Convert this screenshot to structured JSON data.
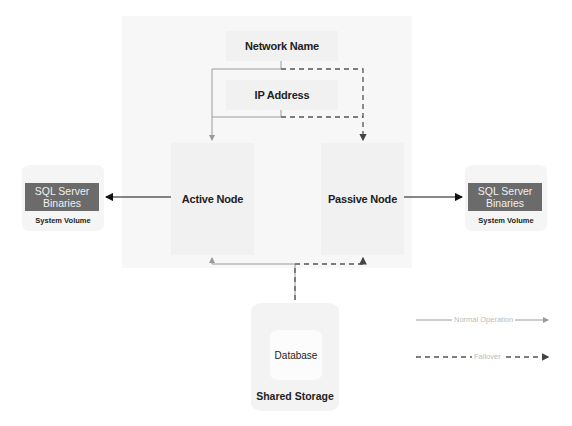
{
  "diagram": {
    "cluster": {
      "network_name": "Network Name",
      "ip_address": "IP Address",
      "active_node": "Active Node",
      "passive_node": "Passive Node"
    },
    "left_volume": {
      "binaries": "SQL Server Binaries",
      "label": "System Volume"
    },
    "right_volume": {
      "binaries": "SQL Server Binaries",
      "label": "System Volume"
    },
    "storage": {
      "database": "Database",
      "label": "Shared Storage"
    },
    "legend": {
      "normal": "Normal Operation",
      "failover": "Failover"
    },
    "colors": {
      "normal_line": "#9a9a9a",
      "failover_line": "#555555",
      "binaries_fill": "#6b6b6b"
    }
  }
}
